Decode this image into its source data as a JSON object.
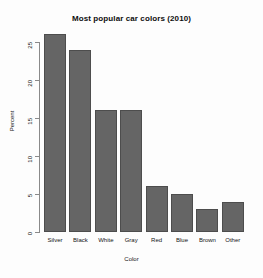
{
  "chart_data": {
    "type": "bar",
    "title": "Most popular car colors (2010)",
    "xlabel": "Color",
    "ylabel": "Percent",
    "categories": [
      "Silver",
      "Black",
      "White",
      "Gray",
      "Red",
      "Blue",
      "Brown",
      "Other"
    ],
    "values": [
      26,
      24,
      16,
      16,
      6,
      5,
      3,
      4
    ],
    "ylim": [
      0,
      26
    ],
    "yticks": [
      0,
      5,
      10,
      15,
      20,
      25
    ],
    "ytick_labels": [
      "0",
      "5",
      "10",
      "15",
      "20",
      "25"
    ],
    "grid": false,
    "legend": "none",
    "bar_color": "#656565",
    "bar_border_color": "#4d4d4d",
    "axis_color": "#8a8a8a",
    "background_color": "#fdfdfd",
    "text_color": "#141414"
  }
}
